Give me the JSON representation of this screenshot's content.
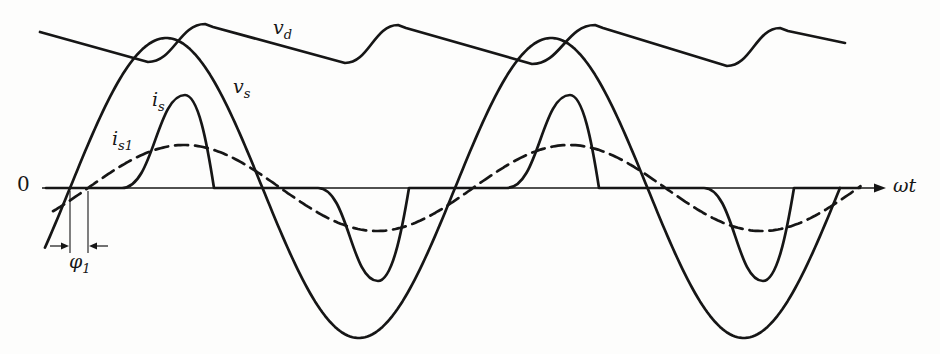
{
  "figure": {
    "background": "#fdfdfc",
    "ink_color": "#161616",
    "width_px": 940,
    "height_px": 354
  },
  "labels": {
    "zero": "0",
    "vd": {
      "main": "v",
      "sub": "d"
    },
    "vs": {
      "main": "v",
      "sub": "s"
    },
    "is": {
      "main": "i",
      "sub": "s"
    },
    "is1": {
      "main": "i",
      "sub": "s1"
    },
    "phi1": {
      "main": "φ",
      "sub": "1"
    },
    "omega_t": "ωt"
  },
  "chart_data": {
    "type": "line",
    "title": "",
    "xlabel": "ωt",
    "ylabel": "",
    "origin_label": "0",
    "grid": false,
    "axis": {
      "y_px": 188,
      "x_start_px": 42,
      "x_end_px": 874,
      "arrow_tip_x_px": 886
    },
    "series": [
      {
        "name": "v_d",
        "kind": "piecewise",
        "style": "solid",
        "description": "dc-side voltage: linear capacitor-discharge ramps joined by sine-following rises, ripple at twice the source frequency",
        "points": [
          [
            40,
            32,
            "M"
          ],
          [
            148,
            62,
            "L"
          ],
          [
            205,
            24,
            "S"
          ],
          [
            213,
            27,
            "L"
          ],
          [
            345,
            63,
            "L"
          ],
          [
            398,
            25,
            "S"
          ],
          [
            406,
            28,
            "L"
          ],
          [
            532,
            64,
            "L"
          ],
          [
            595,
            25,
            "S"
          ],
          [
            603,
            28,
            "L"
          ],
          [
            727,
            66,
            "L"
          ],
          [
            780,
            28,
            "S"
          ],
          [
            788,
            31,
            "L"
          ],
          [
            845,
            43,
            "L"
          ]
        ]
      },
      {
        "name": "v_s",
        "kind": "sine",
        "style": "solid",
        "description": "source voltage sinusoid",
        "amplitude_px": 150,
        "period_px": 385,
        "zero_up_cross_x_px": 70,
        "x_start_px": 45,
        "x_end_px": 841
      },
      {
        "name": "i_s",
        "kind": "pulses",
        "style": "solid",
        "description": "distorted source current: narrow pulses near voltage peaks, zero elsewhere",
        "baseline_y_px": 188,
        "x_start_px": 46,
        "x_end_px": 860,
        "pulses": [
          {
            "start_x": 122,
            "extreme_x": 185,
            "end_x": 214,
            "extreme_y": 95
          },
          {
            "start_x": 318,
            "extreme_x": 378,
            "end_x": 409,
            "extreme_y": 281
          },
          {
            "start_x": 507,
            "extreme_x": 570,
            "end_x": 599,
            "extreme_y": 95
          },
          {
            "start_x": 704,
            "extreme_x": 763,
            "end_x": 794,
            "extreme_y": 281
          }
        ]
      },
      {
        "name": "i_s1",
        "kind": "sine",
        "style": "dashed",
        "description": "fundamental component of source current, lagging v_s by phi-1",
        "amplitude_px": 43,
        "period_px": 385,
        "zero_up_cross_x_px": 88,
        "x_start_px": 53,
        "x_end_px": 862,
        "dash_pattern": "13 7"
      }
    ],
    "annotations": {
      "phi1": {
        "label": "φ1",
        "marker_x1_px": 70,
        "marker_x2_px": 88,
        "marker_y_top_px": 191,
        "marker_y_bottom_px": 253,
        "arrow_y_px": 246,
        "left_arrow_tail_x_px": 50,
        "right_arrow_tail_x_px": 108
      }
    }
  }
}
